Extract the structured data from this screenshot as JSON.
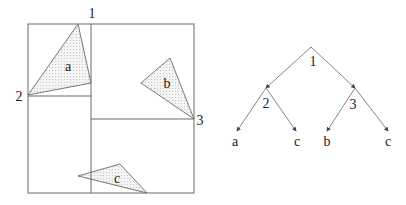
{
  "colors": {
    "line": "#6a6a6a",
    "text": "#222222",
    "fill_dot": "#bdbdbd",
    "background": "#ffffff"
  },
  "partition": {
    "outer_box": {
      "x1": 28,
      "y1": 24,
      "x2": 194,
      "y2": 193
    },
    "split_lines": [
      {
        "id": "1",
        "x1": 91,
        "y1": 24,
        "x2": 91,
        "y2": 193
      },
      {
        "id": "2",
        "x1": 28,
        "y1": 96,
        "x2": 91,
        "y2": 96
      },
      {
        "id": "3",
        "x1": 91,
        "y1": 119,
        "x2": 194,
        "y2": 119
      }
    ],
    "split_labels": [
      {
        "text": "1",
        "x": 92,
        "y": 18
      },
      {
        "text": "2",
        "x": 19,
        "y": 101
      },
      {
        "text": "3",
        "x": 200,
        "y": 125
      }
    ],
    "triangles": [
      {
        "label": "a",
        "points": "78,24 28,95 91,83",
        "lx": 68,
        "ly": 71
      },
      {
        "label": "b",
        "points": "170,58 141,83 194,119",
        "lx": 167,
        "ly": 88
      },
      {
        "label": "c",
        "points": "78,176 120,164 147,193",
        "lx": 117,
        "ly": 183
      }
    ]
  },
  "tree": {
    "nodes": [
      {
        "id": "1",
        "label": "1",
        "x": 311,
        "y": 47,
        "lx": 313,
        "ly": 66
      },
      {
        "id": "2",
        "label": "2",
        "x": 266,
        "y": 88,
        "lx": 266,
        "ly": 108
      },
      {
        "id": "3",
        "label": "3",
        "x": 355,
        "y": 88,
        "lx": 353,
        "ly": 109
      }
    ],
    "leaves": [
      {
        "label": "a",
        "x": 237,
        "y": 131,
        "lx": 235,
        "ly": 146
      },
      {
        "label": "c",
        "x": 296,
        "y": 131,
        "lx": 297,
        "ly": 146
      },
      {
        "label": "b",
        "x": 327,
        "y": 131,
        "lx": 327,
        "ly": 146
      },
      {
        "label": "c",
        "x": 388,
        "y": 131,
        "lx": 388,
        "ly": 146
      }
    ],
    "edges": [
      {
        "from": "1",
        "to": "2"
      },
      {
        "from": "1",
        "to": "3"
      },
      {
        "from": "2",
        "to": "leaf0"
      },
      {
        "from": "2",
        "to": "leaf1"
      },
      {
        "from": "3",
        "to": "leaf2"
      },
      {
        "from": "3",
        "to": "leaf3"
      }
    ]
  }
}
